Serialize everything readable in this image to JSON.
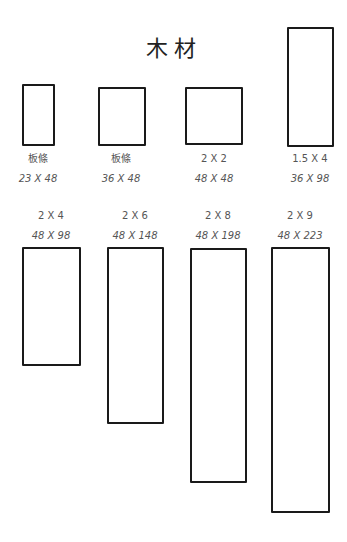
{
  "title": "木材",
  "boards": [
    {
      "name": "板條",
      "size": "23 X 48",
      "box": {
        "x": 22,
        "y": 84,
        "w": 33,
        "h": 62
      },
      "label": {
        "x": 38,
        "y": 152
      }
    },
    {
      "name": "板條",
      "size": "36 X 48",
      "box": {
        "x": 98,
        "y": 87,
        "w": 48,
        "h": 59
      },
      "label": {
        "x": 121,
        "y": 152
      }
    },
    {
      "name": "2 X 2",
      "size": "48 X 48",
      "box": {
        "x": 185,
        "y": 87,
        "w": 58,
        "h": 58
      },
      "label": {
        "x": 214,
        "y": 152
      }
    },
    {
      "name": "1.5 X 4",
      "size": "36 X 98",
      "box": {
        "x": 287,
        "y": 27,
        "w": 47,
        "h": 120
      },
      "label": {
        "x": 310,
        "y": 152
      }
    },
    {
      "name": "2 X 4",
      "size": "48 X 98",
      "box": {
        "x": 22,
        "y": 247,
        "w": 59,
        "h": 119
      },
      "label": {
        "x": 51,
        "y": 209
      }
    },
    {
      "name": "2 X 6",
      "size": "48 X 148",
      "box": {
        "x": 107,
        "y": 247,
        "w": 57,
        "h": 177
      },
      "label": {
        "x": 135,
        "y": 209
      }
    },
    {
      "name": "2 X 8",
      "size": "48 X 198",
      "box": {
        "x": 190,
        "y": 248,
        "w": 57,
        "h": 235
      },
      "label": {
        "x": 218,
        "y": 209
      }
    },
    {
      "name": "2 X 9",
      "size": "48 X 223",
      "box": {
        "x": 271,
        "y": 247,
        "w": 59,
        "h": 266
      },
      "label": {
        "x": 300,
        "y": 209
      }
    }
  ]
}
